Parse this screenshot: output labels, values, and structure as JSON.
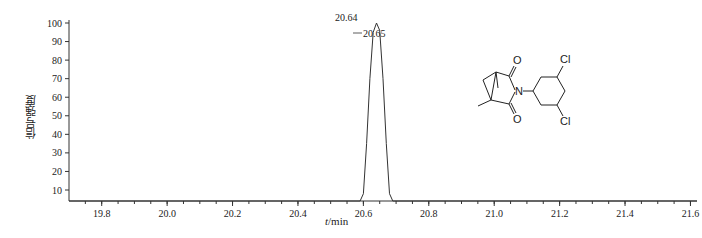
{
  "chart_data": {
    "type": "line",
    "title": "",
    "xlabel": "t/min",
    "ylabel": "信号强度",
    "xlim": [
      19.7,
      21.62
    ],
    "ylim": [
      4,
      100
    ],
    "x_ticks": [
      19.8,
      20.0,
      20.2,
      20.4,
      20.6,
      20.8,
      21.0,
      21.2,
      21.4,
      21.6
    ],
    "x_tick_labels": [
      "19.8",
      "20.0",
      "20.2",
      "20.4",
      "20.6",
      "20.8",
      "21.0",
      "21.2",
      "21.4",
      "21.6"
    ],
    "y_ticks": [
      10,
      20,
      30,
      40,
      50,
      60,
      70,
      80,
      90,
      100
    ],
    "y_tick_labels": [
      "10",
      "20",
      "30",
      "40",
      "50",
      "60",
      "70",
      "80",
      "90",
      "100"
    ],
    "grid": false,
    "series": [
      {
        "name": "chromatogram",
        "x": [
          19.7,
          20.59,
          20.6,
          20.61,
          20.62,
          20.63,
          20.64,
          20.65,
          20.66,
          20.67,
          20.68,
          20.69,
          21.62
        ],
        "y": [
          4,
          4,
          8,
          35,
          70,
          95,
          100,
          96,
          70,
          35,
          8,
          4,
          4
        ]
      }
    ],
    "annotations": [
      {
        "text": "20.64",
        "x": 20.64,
        "y": 100
      },
      {
        "text": "20.65",
        "x": 20.65,
        "y": 96
      }
    ],
    "inset": {
      "type": "chemical-structure",
      "labels": [
        "O",
        "N",
        "O",
        "Cl",
        "Cl"
      ]
    }
  },
  "labels": {
    "ylabel": "信号强度",
    "xlabel_var": "t",
    "xlabel_unit": "/min",
    "peak1": "20.64",
    "peak2": "20.65"
  },
  "structure": {
    "o_top": "O",
    "o_bottom": "O",
    "n": "N",
    "cl_top": "Cl",
    "cl_bottom": "Cl"
  }
}
